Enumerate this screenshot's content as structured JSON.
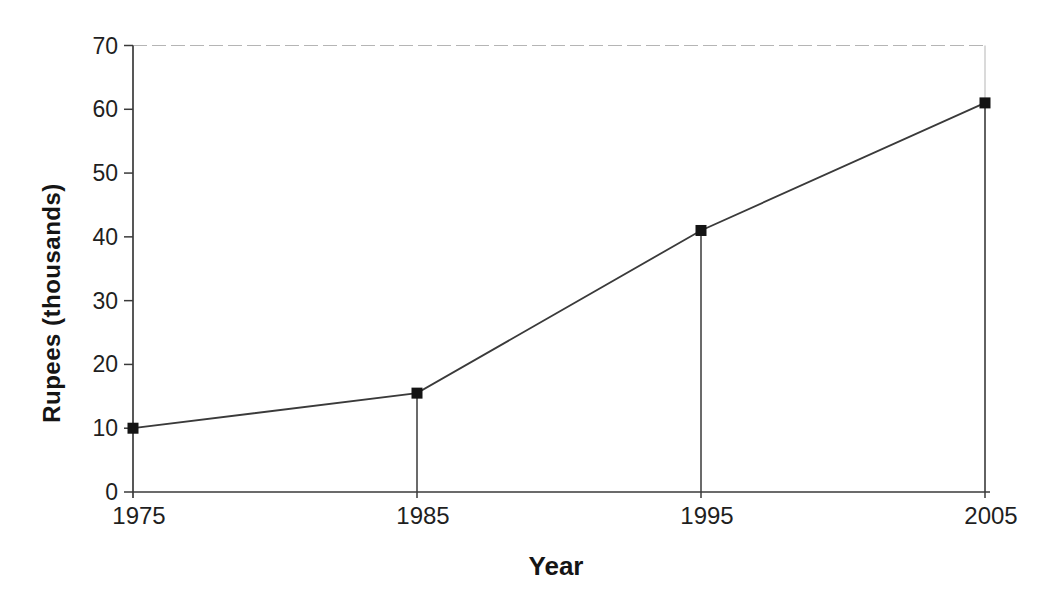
{
  "chart_data": {
    "type": "line",
    "title": "",
    "xlabel": "Year",
    "ylabel": "Rupees (thousands)",
    "x": [
      1975,
      1985,
      1995,
      2005
    ],
    "xtick_labels": [
      "1975",
      "1985",
      "1995",
      "2005"
    ],
    "values": [
      10,
      15.5,
      41,
      61
    ],
    "ylim": [
      0,
      70
    ],
    "yticks": [
      0,
      10,
      20,
      30,
      40,
      50,
      60,
      70
    ],
    "legend": "none",
    "marker": "filled-square",
    "drop_lines_to_x_axis": true,
    "grid": "top-border-only",
    "colors": {
      "line": "#3a3a3a",
      "marker": "#141414",
      "axis": "#3a3a3a",
      "tick_text": "#1f1f1f",
      "light_border": "#b5b5b5",
      "background": "#ffffff"
    }
  }
}
